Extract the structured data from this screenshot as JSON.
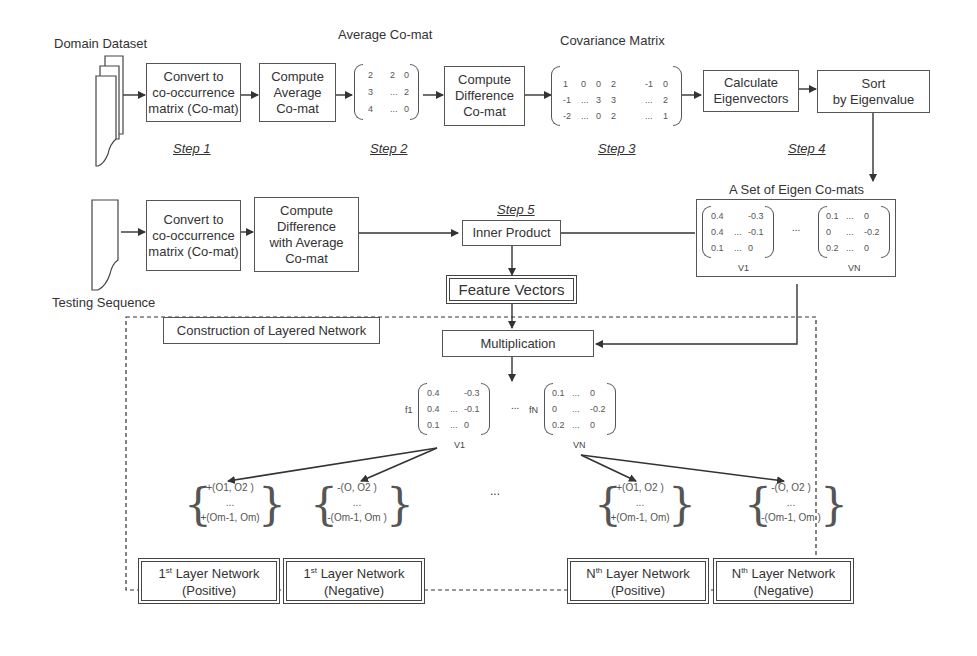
{
  "inputs": {
    "domain_dataset": "Domain Dataset",
    "testing_sequence": "Testing Sequence"
  },
  "steps": {
    "step1": "Step 1",
    "step2": "Step 2",
    "step3": "Step 3",
    "step4": "Step 4",
    "step5": "Step 5"
  },
  "boxes": {
    "convert_top": "Convert to\nco-occurrence\nmatrix (Co-mat)",
    "compute_avg": "Compute\nAverage\nCo-mat",
    "compute_diff": "Compute\nDifference\nCo-mat",
    "calc_eigen": "Calculate\nEigenvectors",
    "sort_eigen": "Sort\nby Eigenvalue",
    "convert_bottom": "Convert to\nco-occurrence\nmatrix (Co-mat)",
    "compute_diff_avg": "Compute\nDifference\nwith Average\nCo-mat",
    "inner_product": "Inner Product",
    "feature_vectors": "Feature Vectors",
    "construction": "Construction of Layered Network",
    "multiplication": "Multiplication"
  },
  "labels": {
    "average_comat": "Average Co-mat",
    "covariance_matrix": "Covariance Matrix",
    "eigen_set": "A Set of Eigen Co-mats",
    "v1": "V1",
    "vn": "VN",
    "f1": "f1",
    "fn": "fN",
    "ellipsis": "...",
    "ellipsis_layers": "..."
  },
  "matrices": {
    "average_comat": [
      [
        "2",
        "2",
        "0"
      ],
      [
        "3",
        "...",
        "2"
      ],
      [
        "4",
        "...",
        "0"
      ]
    ],
    "covariance": [
      [
        "1",
        "0",
        "0",
        "2",
        "",
        "-1",
        "0"
      ],
      [
        "-1",
        "...",
        "3",
        "3",
        "",
        "...",
        "2"
      ],
      [
        "-2",
        "...",
        "0",
        "2",
        "",
        "...",
        "1"
      ]
    ],
    "v1": [
      [
        "0.4",
        "",
        "-0.3"
      ],
      [
        "0.4",
        "...",
        "-0.1"
      ],
      [
        "0.1",
        "...",
        "0"
      ]
    ],
    "vn": [
      [
        "0.1",
        "...",
        "0"
      ],
      [
        "0",
        "...",
        "-0.2"
      ],
      [
        "0.2",
        "...",
        "0"
      ]
    ]
  },
  "pair_sets": {
    "positive": {
      "first": "+(O1, O2 )",
      "mid": "...",
      "last": "+(Om-1, Om)"
    },
    "negative": {
      "first": "-(O,  O2 )",
      "mid": "...",
      "last": "-(Om-1, Om )"
    }
  },
  "layers": [
    {
      "ord": "1",
      "sup": "st",
      "name": " Layer Network",
      "kind": "(Positive)"
    },
    {
      "ord": "1",
      "sup": "st",
      "name": " Layer Network",
      "kind": "(Negative)"
    },
    {
      "ord": "N",
      "sup": "th",
      "name": " Layer Network",
      "kind": "(Positive)"
    },
    {
      "ord": "N",
      "sup": "th",
      "name": " Layer Network",
      "kind": "(Negative)"
    }
  ]
}
